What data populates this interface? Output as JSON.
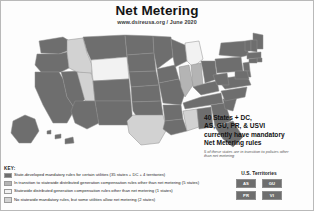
{
  "header": {
    "title": "Net Metering",
    "subtitle": "www.dsireusa.org / June 2020"
  },
  "callout": {
    "line1": "40 States + DC,",
    "line2": "AS, GU, PR, & USVI",
    "line3": "currently have mandatory",
    "line4": "Net Metering rules",
    "note": "5 of these states are in transition to policies other than net metering"
  },
  "key": {
    "label": "KEY:",
    "items": [
      {
        "text": "State-developed mandatory rules for certain utilities (35 states + DC + 4 territories)",
        "color": "#6e6e6e"
      },
      {
        "text": "In transition to statewide distributed generation compensation rules other than net metering (5 states)",
        "color": "#b4b4b4"
      },
      {
        "text": "Statewide distributed generation compensation rules other than net metering (1 states)",
        "color": "#f2f2f2"
      },
      {
        "text": "No statewide mandatory rules, but some utilities allow net metering (2 states)",
        "color": "#d2d2d2"
      }
    ]
  },
  "territories": {
    "title": "U.S. Territories",
    "items": [
      {
        "abbr": "AS",
        "color": "#6e6e6e"
      },
      {
        "abbr": "GU",
        "color": "#6e6e6e"
      },
      {
        "abbr": "PR",
        "color": "#6e6e6e"
      },
      {
        "abbr": "VI",
        "color": "#6e6e6e"
      }
    ]
  },
  "map": {
    "name": "united-states-net-metering-map",
    "colors": {
      "mandatory": "#6e6e6e",
      "transition": "#b4b4b4",
      "other_rules": "#f2f2f2",
      "none": "#d2d2d2",
      "border": "#8f8f8f",
      "background": "#fdfdfd"
    }
  }
}
